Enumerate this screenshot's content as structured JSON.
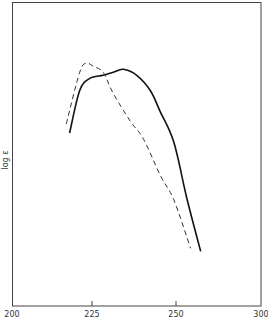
{
  "chart_data": {
    "type": "line",
    "title": "",
    "xlabel": "",
    "ylabel": "log ε",
    "x_tick_labels": [
      "200",
      "225",
      "250",
      "300"
    ],
    "x_tick_positions_px": [
      12,
      92,
      176,
      261
    ],
    "xlim": [
      200,
      300
    ],
    "ylim": [
      0,
      1
    ],
    "grid": false,
    "legend": null,
    "y_note": "Y axis has no numeric ticks; values are relative (0 = bottom of frame, 1 = top of frame).",
    "series": [
      {
        "name": "solid curve",
        "style": "solid",
        "color": "#111111",
        "points": [
          {
            "x": 217,
            "y": 0.57
          },
          {
            "x": 220,
            "y": 0.71
          },
          {
            "x": 223,
            "y": 0.75
          },
          {
            "x": 227,
            "y": 0.76
          },
          {
            "x": 230,
            "y": 0.77
          },
          {
            "x": 233,
            "y": 0.78
          },
          {
            "x": 237,
            "y": 0.76
          },
          {
            "x": 241,
            "y": 0.71
          },
          {
            "x": 244,
            "y": 0.64
          },
          {
            "x": 248,
            "y": 0.54
          },
          {
            "x": 252,
            "y": 0.35
          },
          {
            "x": 256,
            "y": 0.18
          }
        ]
      },
      {
        "name": "dashed curve",
        "style": "dashed",
        "color": "#333333",
        "points": [
          {
            "x": 216,
            "y": 0.6
          },
          {
            "x": 220,
            "y": 0.77
          },
          {
            "x": 222,
            "y": 0.8
          },
          {
            "x": 224,
            "y": 0.79
          },
          {
            "x": 227,
            "y": 0.77
          },
          {
            "x": 230,
            "y": 0.7
          },
          {
            "x": 235,
            "y": 0.61
          },
          {
            "x": 239,
            "y": 0.55
          },
          {
            "x": 244,
            "y": 0.43
          },
          {
            "x": 248,
            "y": 0.35
          },
          {
            "x": 253,
            "y": 0.19
          }
        ]
      }
    ]
  },
  "axes": {
    "ylabel": "log ε",
    "xticks": [
      "200",
      "225",
      "250",
      "300"
    ]
  }
}
